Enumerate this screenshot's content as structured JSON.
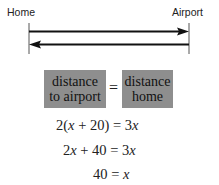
{
  "diagram": {
    "left_label": "Home",
    "right_label": "Airport",
    "arrows": [
      {
        "direction": "right",
        "from": "Home",
        "to": "Airport"
      },
      {
        "direction": "left",
        "from": "Airport",
        "to": "Home"
      }
    ]
  },
  "equation_boxes": {
    "left_box": {
      "line1": "distance",
      "line2": "to airport"
    },
    "equals": "=",
    "right_box": {
      "line1": "distance",
      "line2": "home"
    },
    "box_color": "#8e8e8e"
  },
  "equations": [
    "2(x + 20) = 3x",
    "2x + 40 = 3x",
    "40 = x"
  ]
}
